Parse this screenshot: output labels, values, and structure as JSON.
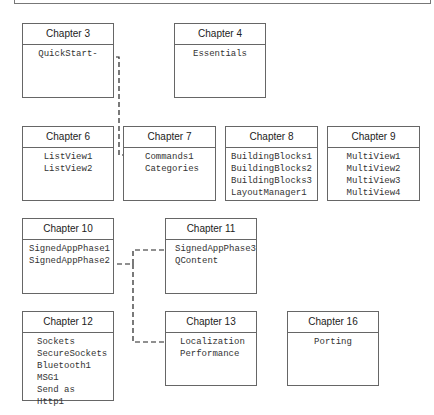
{
  "chapters": [
    {
      "id": "ch3",
      "title": "Chapter 3",
      "items": [
        "QuickStart-"
      ],
      "x": 22,
      "y": 23,
      "w": 92,
      "h": 75,
      "align": "center"
    },
    {
      "id": "ch4",
      "title": "Chapter 4",
      "items": [
        "Essentials"
      ],
      "x": 174,
      "y": 23,
      "w": 92,
      "h": 75,
      "align": "center"
    },
    {
      "id": "ch6",
      "title": "Chapter 6",
      "items": [
        "ListView1",
        "ListView2"
      ],
      "x": 22,
      "y": 126,
      "w": 92,
      "h": 75,
      "align": "center"
    },
    {
      "id": "ch7",
      "title": "Chapter 7",
      "items": [
        "Commands1",
        "Categories"
      ],
      "x": 123,
      "y": 126,
      "w": 93,
      "h": 75,
      "align": "left",
      "pad": 21
    },
    {
      "id": "ch8",
      "title": "Chapter 8",
      "items": [
        "BuildingBlocks1",
        "BuildingBlocks2",
        "BuildingBlocks3",
        "LayoutManager1"
      ],
      "x": 225,
      "y": 126,
      "w": 93,
      "h": 75,
      "align": "left",
      "pad": 5
    },
    {
      "id": "ch9",
      "title": "Chapter 9",
      "items": [
        "MultiView1",
        "MultiView2",
        "MultiView3",
        "MultiView4"
      ],
      "x": 327,
      "y": 126,
      "w": 93,
      "h": 75,
      "align": "center"
    },
    {
      "id": "ch10",
      "title": "Chapter 10",
      "items": [
        "SignedAppPhase1",
        "SignedAppPhase2"
      ],
      "x": 22,
      "y": 218,
      "w": 92,
      "h": 76,
      "align": "left",
      "pad": 6
    },
    {
      "id": "ch11",
      "title": "Chapter 11",
      "items": [
        "SignedAppPhase3",
        "QContent"
      ],
      "x": 165,
      "y": 218,
      "w": 92,
      "h": 76,
      "align": "left",
      "pad": 9
    },
    {
      "id": "ch12",
      "title": "Chapter 12",
      "items": [
        "Sockets",
        "SecureSockets",
        "Bluetooth1",
        "MSG1",
        "Send as",
        "Http1"
      ],
      "x": 22,
      "y": 311,
      "w": 92,
      "h": 90,
      "align": "left",
      "pad": 14
    },
    {
      "id": "ch13",
      "title": "Chapter 13",
      "items": [
        "Localization",
        "Performance"
      ],
      "x": 165,
      "y": 311,
      "w": 92,
      "h": 75,
      "align": "left",
      "pad": 14
    },
    {
      "id": "ch16",
      "title": "Chapter 16",
      "items": [
        "Porting"
      ],
      "x": 287,
      "y": 311,
      "w": 92,
      "h": 75,
      "align": "center"
    }
  ],
  "links": [
    {
      "from": "ch3.QuickStart",
      "to": "ch7.Commands1",
      "path": "M100,57 L119,57 L119,155 L144,155"
    },
    {
      "from": "ch10.SignedAppPhase2",
      "to": "ch11.SignedAppPhase3",
      "path": "M109,264 L133,264 L133,250 L171,250"
    },
    {
      "from": "ch10.SignedAppPhase2",
      "to": "ch13.Localization",
      "path": "M133,264 L133,342 L169,342"
    }
  ]
}
